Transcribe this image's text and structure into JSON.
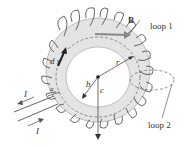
{
  "diagram": {
    "labels": {
      "B": "B",
      "loop1": "loop 1",
      "loop2": "loop 2",
      "ds": "d s",
      "I_top": "I",
      "I_bottom": "I",
      "a": "a",
      "b": "b",
      "c": "c",
      "r": "r"
    },
    "colors": {
      "torus_fill": "#e4e4e4",
      "wire": "#555555",
      "arrow": "#222222",
      "B_arrow": "#888888"
    }
  }
}
